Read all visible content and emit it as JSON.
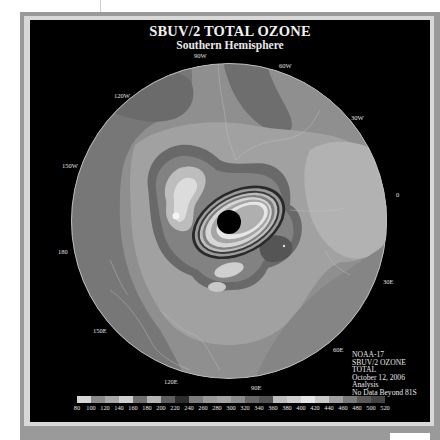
{
  "header": {
    "title": "SBUV/2 TOTAL OZONE",
    "subtitle": "Southern Hemisphere"
  },
  "map": {
    "projection": "south-polar-stereographic",
    "center": [
      229,
      221
    ],
    "radius": 158,
    "colors": {
      "background": "#000000",
      "disk_base": "#8f8f8f",
      "dark_band": "#6e6e6e",
      "mid_band": "#9c9c9c",
      "light_band": "#bcbcbc",
      "lighter": "#d2d2d2",
      "brightest": "#e8e8e8",
      "hole_core": "#000000",
      "coastline": "#c8c8c8"
    },
    "longitude_labels": [
      {
        "text": "90W",
        "x": 194,
        "y": 52
      },
      {
        "text": "60W",
        "x": 279,
        "y": 62
      },
      {
        "text": "120W",
        "x": 114,
        "y": 92
      },
      {
        "text": "30W",
        "x": 351,
        "y": 114
      },
      {
        "text": "150W",
        "x": 62,
        "y": 162
      },
      {
        "text": "0",
        "x": 396,
        "y": 191
      },
      {
        "text": "180",
        "x": 58,
        "y": 248
      },
      {
        "text": "30E",
        "x": 383,
        "y": 278
      },
      {
        "text": "150E",
        "x": 93,
        "y": 327
      },
      {
        "text": "60E",
        "x": 333,
        "y": 346
      },
      {
        "text": "120E",
        "x": 164,
        "y": 378
      },
      {
        "text": "90E",
        "x": 251,
        "y": 384
      }
    ]
  },
  "info_block": {
    "lines": [
      "NOAA-17",
      "SBUV/2 OZONE",
      "TOTAL",
      "October 12, 2006",
      "Analysis",
      "No Data Beyond 81S"
    ]
  },
  "color_scale": {
    "units": "Dobson Units",
    "labels": [
      "80",
      "100",
      "120",
      "140",
      "160",
      "180",
      "200",
      "220",
      "240",
      "260",
      "280",
      "300",
      "320",
      "340",
      "360",
      "380",
      "400",
      "420",
      "440",
      "460",
      "480",
      "500",
      "520"
    ],
    "colors": [
      "#d6d6d6",
      "#8a8a8a",
      "#a8a8a8",
      "#cfcfcf",
      "#707070",
      "#b4b4b4",
      "#5e5e5e",
      "#2c2c2c",
      "#7c7c7c",
      "#989898",
      "#a4a4a4",
      "#8c8c8c",
      "#666666",
      "#525252",
      "#bdbdbd",
      "#cfcfcf",
      "#e6e6e6",
      "#cacaca",
      "#a0a0a0",
      "#7a7a7a",
      "#5a5a5a",
      "#444444"
    ]
  }
}
